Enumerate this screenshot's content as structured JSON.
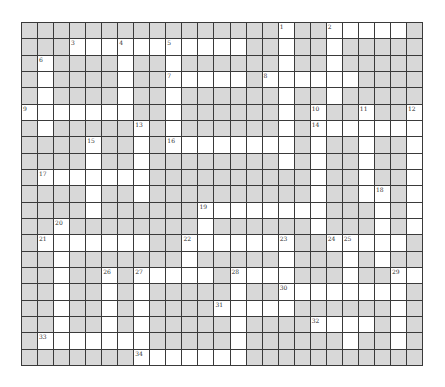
{
  "puzzle": {
    "rows": 21,
    "cols": 25,
    "colors": {
      "open": "#ffffff",
      "block": "#d8d8d8",
      "line": "#3a3a3a"
    },
    "layout": [
      "0000000000000000100111110",
      "0001111111111100100100000",
      "0100001001000000100100000",
      "0100001001111101111110000",
      "0100001001000000100100000",
      "1111111001000000101001001",
      "0100000101000000101111111",
      "0000100101111111101001001",
      "0000100100000000101001001",
      "0111111100000000001001001",
      "0000100100000000001001101",
      "0000100000011111111000101",
      "0010000000010000001000101",
      "0111111100111111100111110",
      "0010000000100000100010100",
      "0010010111110111100010011",
      "0010010100000100111111110",
      "0010010100001111100000010",
      "0010010100000100001111010",
      "0111111100000100000010010",
      "0000000111111100000000000"
    ],
    "numbers": [
      {
        "n": "1",
        "r": 0,
        "c": 16
      },
      {
        "n": "2",
        "r": 0,
        "c": 19
      },
      {
        "n": "3",
        "r": 1,
        "c": 3
      },
      {
        "n": "4",
        "r": 1,
        "c": 6
      },
      {
        "n": "5",
        "r": 1,
        "c": 9
      },
      {
        "n": "6",
        "r": 2,
        "c": 1
      },
      {
        "n": "7",
        "r": 3,
        "c": 9
      },
      {
        "n": "8",
        "r": 3,
        "c": 15
      },
      {
        "n": "9",
        "r": 5,
        "c": 0
      },
      {
        "n": "10",
        "r": 5,
        "c": 18
      },
      {
        "n": "11",
        "r": 5,
        "c": 21
      },
      {
        "n": "12",
        "r": 5,
        "c": 24
      },
      {
        "n": "13",
        "r": 6,
        "c": 7
      },
      {
        "n": "14",
        "r": 6,
        "c": 18
      },
      {
        "n": "15",
        "r": 7,
        "c": 4
      },
      {
        "n": "16",
        "r": 7,
        "c": 9
      },
      {
        "n": "17",
        "r": 9,
        "c": 1
      },
      {
        "n": "18",
        "r": 10,
        "c": 22
      },
      {
        "n": "19",
        "r": 11,
        "c": 11
      },
      {
        "n": "20",
        "r": 12,
        "c": 2
      },
      {
        "n": "21",
        "r": 13,
        "c": 1
      },
      {
        "n": "22",
        "r": 13,
        "c": 10
      },
      {
        "n": "23",
        "r": 13,
        "c": 16
      },
      {
        "n": "24",
        "r": 13,
        "c": 19
      },
      {
        "n": "25",
        "r": 13,
        "c": 20
      },
      {
        "n": "26",
        "r": 15,
        "c": 5
      },
      {
        "n": "27",
        "r": 15,
        "c": 7
      },
      {
        "n": "28",
        "r": 15,
        "c": 13
      },
      {
        "n": "29",
        "r": 15,
        "c": 23
      },
      {
        "n": "30",
        "r": 16,
        "c": 16
      },
      {
        "n": "31",
        "r": 17,
        "c": 12
      },
      {
        "n": "32",
        "r": 18,
        "c": 18
      },
      {
        "n": "33",
        "r": 19,
        "c": 1
      },
      {
        "n": "34",
        "r": 20,
        "c": 7
      }
    ]
  }
}
